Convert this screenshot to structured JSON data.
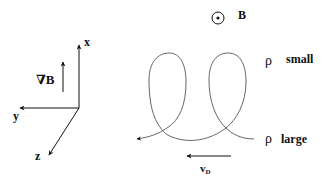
{
  "axes": {
    "x_label": "x",
    "y_label": "y",
    "z_label": "z",
    "gradient_label": "∇B"
  },
  "field": {
    "symbol": "⊙",
    "label": "B"
  },
  "annotations": {
    "rho_small_symbol": "ρ",
    "rho_small_text": "small",
    "rho_large_symbol": "ρ",
    "rho_large_text": "large"
  },
  "drift": {
    "label_main": "v",
    "label_sub": "D"
  },
  "colors": {
    "line": "#111111",
    "curve": "#555555"
  }
}
